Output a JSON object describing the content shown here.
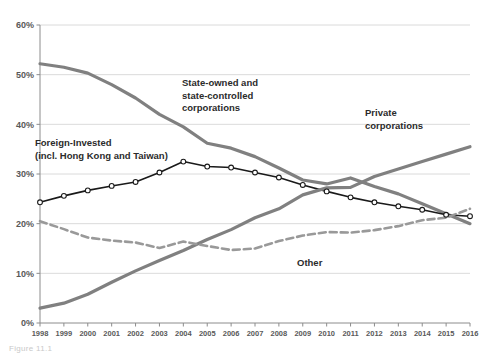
{
  "figure": {
    "caption": "Figure 11.1"
  },
  "chart_data": {
    "type": "line",
    "title": "",
    "xlabel": "",
    "ylabel": "",
    "xlim": [
      1998,
      2016
    ],
    "ylim": [
      0,
      60
    ],
    "grid": true,
    "legend_position": "inline-annotations",
    "x": [
      1998,
      1999,
      2000,
      2001,
      2002,
      2003,
      2004,
      2005,
      2006,
      2007,
      2008,
      2009,
      2010,
      2011,
      2012,
      2013,
      2014,
      2015,
      2016
    ],
    "xtick_labels": [
      "1998",
      "1999",
      "2000",
      "2001",
      "2002",
      "2003",
      "2004",
      "2005",
      "2006",
      "2007",
      "2008",
      "2009",
      "2010",
      "2011",
      "2012",
      "2013",
      "2014",
      "2015",
      "2016"
    ],
    "ytick_labels": [
      "0%",
      "10%",
      "20%",
      "30%",
      "40%",
      "50%",
      "60%"
    ],
    "ytick_values": [
      0,
      10,
      20,
      30,
      40,
      50,
      60
    ],
    "series": [
      {
        "name": "State-owned and state-controlled corporations",
        "label_text": "State-owned and\nstate-controlled\ncorporations",
        "color": "#808080",
        "style": "solid",
        "width": 3.2,
        "markers": false,
        "values": [
          52.2,
          51.5,
          50.3,
          48.0,
          45.3,
          42.0,
          39.5,
          36.2,
          35.2,
          33.5,
          31.2,
          28.8,
          28.0,
          29.2,
          27.5,
          26.0,
          24.0,
          22.0,
          20.0
        ]
      },
      {
        "name": "Foreign-Invested (incl. Hong Kong and Taiwan)",
        "label_text": "Foreign-Invested\n(incl. Hong Kong and Taiwan)",
        "color": "#1a1a1a",
        "style": "solid",
        "width": 1.6,
        "markers": true,
        "values": [
          24.3,
          25.6,
          26.7,
          27.6,
          28.4,
          30.3,
          32.5,
          31.5,
          31.3,
          30.3,
          29.3,
          27.8,
          26.5,
          25.3,
          24.3,
          23.5,
          22.8,
          21.8,
          21.5
        ]
      },
      {
        "name": "Private corporations",
        "label_text": "Private\ncorporations",
        "color": "#808080",
        "style": "solid",
        "width": 3.2,
        "markers": false,
        "values": [
          3.0,
          4.0,
          5.8,
          8.2,
          10.5,
          12.6,
          14.6,
          16.8,
          18.8,
          21.2,
          23.0,
          25.8,
          27.2,
          27.3,
          29.5,
          31.0,
          32.5,
          34.0,
          35.5
        ]
      },
      {
        "name": "Other",
        "label_text": "Other",
        "color": "#999999",
        "style": "dashed",
        "width": 2.6,
        "markers": false,
        "values": [
          20.5,
          18.9,
          17.2,
          16.6,
          16.2,
          15.1,
          16.4,
          15.5,
          14.7,
          15.0,
          16.5,
          17.6,
          18.3,
          18.2,
          18.7,
          19.5,
          20.7,
          21.2,
          23.0
        ]
      }
    ],
    "annotations": [
      {
        "name": "state-owned-label",
        "text_lines": [
          "State-owned and",
          "state-controlled",
          "corporations"
        ],
        "x": 182,
        "y": 86
      },
      {
        "name": "foreign-invested-label",
        "text_lines": [
          "Foreign-Invested",
          "(incl. Hong Kong and Taiwan)"
        ],
        "x": 35,
        "y": 146
      },
      {
        "name": "private-corporations-label",
        "text_lines": [
          "Private",
          "corporations"
        ],
        "x": 365,
        "y": 116
      },
      {
        "name": "other-label",
        "text_lines": [
          "Other"
        ],
        "x": 297,
        "y": 266
      }
    ]
  }
}
